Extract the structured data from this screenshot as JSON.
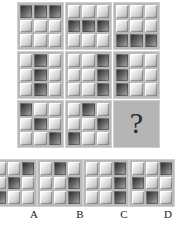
{
  "puzzle": {
    "type": "matrix-reasoning",
    "title": "Raven progressive matrix puzzle",
    "grid_size": "3x3",
    "tile_states": [
      "light",
      "dark"
    ],
    "colors": {
      "panel_background": "#b9b9b9",
      "question_panel_background": "#b5b5b5",
      "tile_light": "#f2f2f2",
      "tile_dark": "#3d3d3d",
      "page_background": "#ffffff",
      "label_text": "#1a1a1a"
    },
    "question_symbol": "?"
  },
  "matrix": {
    "rows": 3,
    "cols": 3,
    "cells": [
      {
        "id": "matrix-cell-1",
        "position": "row1-col1",
        "description": "top row dark",
        "pattern": [
          1,
          1,
          1,
          0,
          0,
          0,
          0,
          0,
          0
        ]
      },
      {
        "id": "matrix-cell-2",
        "position": "row1-col2",
        "description": "middle row dark",
        "pattern": [
          0,
          0,
          0,
          1,
          1,
          1,
          0,
          0,
          0
        ]
      },
      {
        "id": "matrix-cell-3",
        "position": "row1-col3",
        "description": "bottom row dark",
        "pattern": [
          0,
          0,
          0,
          0,
          0,
          0,
          1,
          1,
          1
        ]
      },
      {
        "id": "matrix-cell-4",
        "position": "row2-col1",
        "description": "middle column dark",
        "pattern": [
          0,
          1,
          0,
          0,
          1,
          0,
          0,
          1,
          0
        ]
      },
      {
        "id": "matrix-cell-5",
        "position": "row2-col2",
        "description": "right column dark",
        "pattern": [
          0,
          0,
          1,
          0,
          0,
          1,
          0,
          0,
          1
        ]
      },
      {
        "id": "matrix-cell-6",
        "position": "row2-col3",
        "description": "left column dark",
        "pattern": [
          1,
          0,
          0,
          1,
          0,
          0,
          1,
          0,
          0
        ]
      },
      {
        "id": "matrix-cell-7",
        "position": "row3-col1",
        "description": "main diagonal dark",
        "pattern": [
          1,
          0,
          0,
          0,
          1,
          0,
          0,
          0,
          1
        ]
      },
      {
        "id": "matrix-cell-8",
        "position": "row3-col2",
        "description": "shifted diagonal dark",
        "pattern": [
          0,
          1,
          0,
          0,
          0,
          1,
          1,
          0,
          0
        ]
      },
      {
        "id": "matrix-cell-9",
        "position": "row3-col3",
        "description": "missing element",
        "is_question": true,
        "pattern": []
      }
    ]
  },
  "options": {
    "count": 4,
    "items": [
      {
        "id": "option-a",
        "label": "A",
        "description": "anti-diagonal dark",
        "pattern": [
          0,
          0,
          1,
          0,
          1,
          0,
          1,
          0,
          0
        ]
      },
      {
        "id": "option-b",
        "label": "B",
        "description": "top-middle, middle-right, bottom-right dark",
        "pattern": [
          0,
          1,
          0,
          0,
          0,
          1,
          0,
          0,
          1
        ]
      },
      {
        "id": "option-c",
        "label": "C",
        "description": "right column dark",
        "pattern": [
          0,
          0,
          1,
          0,
          0,
          1,
          0,
          0,
          1
        ]
      },
      {
        "id": "option-d",
        "label": "D",
        "description": "top-right, middle-left, bottom-middle dark",
        "pattern": [
          0,
          0,
          1,
          1,
          0,
          0,
          0,
          1,
          0
        ]
      }
    ]
  }
}
